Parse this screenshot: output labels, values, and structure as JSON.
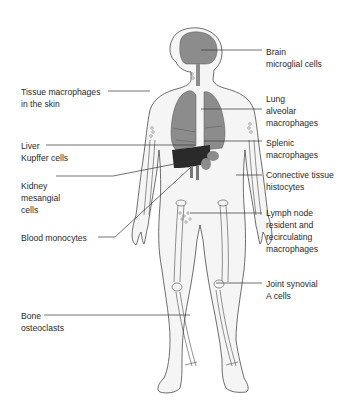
{
  "colors": {
    "outline": "#4a4a4a",
    "organ_fill": "#8c8c8c",
    "liver_fill": "#2a2a2a",
    "body_fill": "#f4f4f4",
    "leader": "#333333",
    "text": "#2a2a2a"
  },
  "labels": {
    "brain": [
      "Brain",
      "microglial cells"
    ],
    "skin": [
      "Tissue macrophages",
      "in the skin"
    ],
    "lung": [
      "Lung",
      "alveolar",
      "macrophages"
    ],
    "liver": [
      "Liver",
      "Kupffer cells"
    ],
    "spleen": [
      "Splenic",
      "macrophages"
    ],
    "connective": [
      "Connective tissue",
      "histocytes"
    ],
    "kidney": [
      "Kidney",
      "mesangial",
      "cells"
    ],
    "lymph": [
      "Lymph node",
      "resident and",
      "recirculating",
      "macrophages"
    ],
    "blood": [
      "Blood monocytes"
    ],
    "joint": [
      "Joint synovial",
      "A cells"
    ],
    "bone": [
      "Bone",
      "osteoclasts"
    ]
  }
}
